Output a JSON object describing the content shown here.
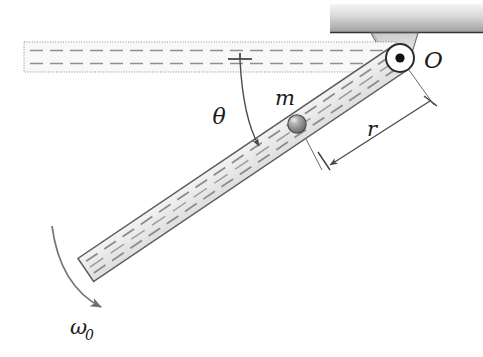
{
  "figure": {
    "type": "mechanics-free-body-diagram",
    "background_color": "#ffffff",
    "ink_color": "#1a1a1a"
  },
  "labels": {
    "pivot": "O",
    "mass": "m",
    "radius": "r",
    "angle": "θ",
    "angular_velocity": "ω",
    "angular_velocity_subscript": "0"
  },
  "elements": {
    "ceiling": {
      "name": "ceiling-support-block",
      "fill_light": "#f2f2f2",
      "fill_dark": "#9a9a9a",
      "x": 330,
      "y": 4,
      "width": 153,
      "height": 29
    },
    "bracket": {
      "name": "pivot-bracket",
      "fill": "#d8d8d8"
    },
    "pivot": {
      "name": "pivot-joint",
      "cx": 400,
      "cy": 58,
      "outer_radius": 14,
      "inner_radius": 4.5,
      "fill": "#ffffff",
      "dot_fill": "#111111"
    },
    "ghost_rod": {
      "name": "reference-horizontal-rod",
      "description": "dotted-outline rod at horizontal reference position",
      "x1": 24,
      "y1": 42,
      "x2": 396,
      "y2": 72,
      "fill": "#f7f7f7",
      "stroke_style": "dotted"
    },
    "rod": {
      "name": "slotted-rod",
      "pivot_x": 400,
      "pivot_y": 58,
      "end_x": 86,
      "end_y": 270,
      "angle_degrees": 34,
      "half_width": 14,
      "fill": "#ededed",
      "stroke": "#5a5a5a"
    },
    "ball": {
      "name": "sliding-mass-ball",
      "cx": 297,
      "cy": 124,
      "radius": 9,
      "fill": "#9c9c9c",
      "highlight": "#cfcfcf"
    },
    "angle_arc": {
      "name": "theta-angle-arc",
      "tick_x1": 228,
      "tick_y1": 59,
      "tick_x2": 252,
      "tick_y2": 59,
      "label_x": 227,
      "label_y": 120
    },
    "radius_dimension": {
      "name": "r-dimension-line",
      "from_x": 430,
      "from_y": 96,
      "to_x": 330,
      "to_y": 164,
      "label_x": 370,
      "label_y": 135
    },
    "omega_arrow": {
      "name": "omega-rotation-arrow",
      "start_x": 52,
      "start_y": 226,
      "end_x": 106,
      "end_y": 312,
      "label_x": 72,
      "label_y": 336
    }
  }
}
